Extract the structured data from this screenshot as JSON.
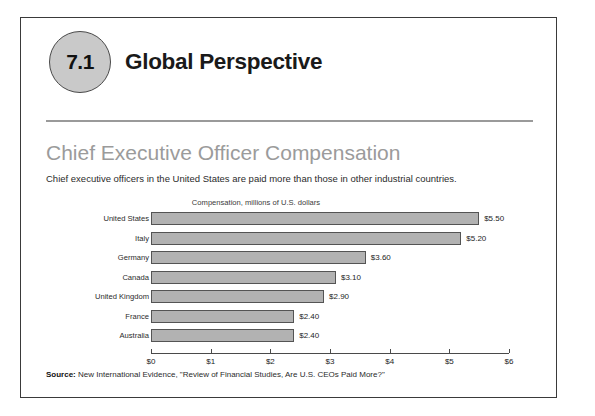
{
  "header": {
    "badge_number": "7.1",
    "chapter_title": "Global Perspective"
  },
  "section": {
    "title": "Chief Executive Officer Compensation",
    "subtitle": "Chief executive officers in the United States are paid more than those in other industrial countries."
  },
  "footer": {
    "source_label": "Source:",
    "source_text": " New International Evidence, \"Review of Financial Studies, Are U.S. CEOs Paid More?\""
  },
  "colors": {
    "bar_fill": "#b2b2b2",
    "bar_border": "#545454",
    "badge_fill": "#c9c9c9",
    "title_gray": "#9b9b9b",
    "rule": "#9a9a9a"
  },
  "chart_data": {
    "type": "bar",
    "orientation": "horizontal",
    "title": "Compensation, millions of U.S. dollars",
    "xlabel": "",
    "ylabel": "",
    "categories": [
      "United States",
      "Italy",
      "Germany",
      "Canada",
      "United Kingdom",
      "France",
      "Australia"
    ],
    "values": [
      5.5,
      5.2,
      3.6,
      3.1,
      2.9,
      2.4,
      2.4
    ],
    "data_labels": [
      "$5.50",
      "$5.20",
      "$3.60",
      "$3.10",
      "$2.90",
      "$2.40",
      "$2.40"
    ],
    "xlim": [
      0,
      6
    ],
    "xticks": [
      0,
      1,
      2,
      3,
      4,
      5,
      6
    ],
    "xtick_labels": [
      "$0",
      "$1",
      "$2",
      "$3",
      "$4",
      "$5",
      "$6"
    ],
    "grid": false,
    "legend": false
  }
}
